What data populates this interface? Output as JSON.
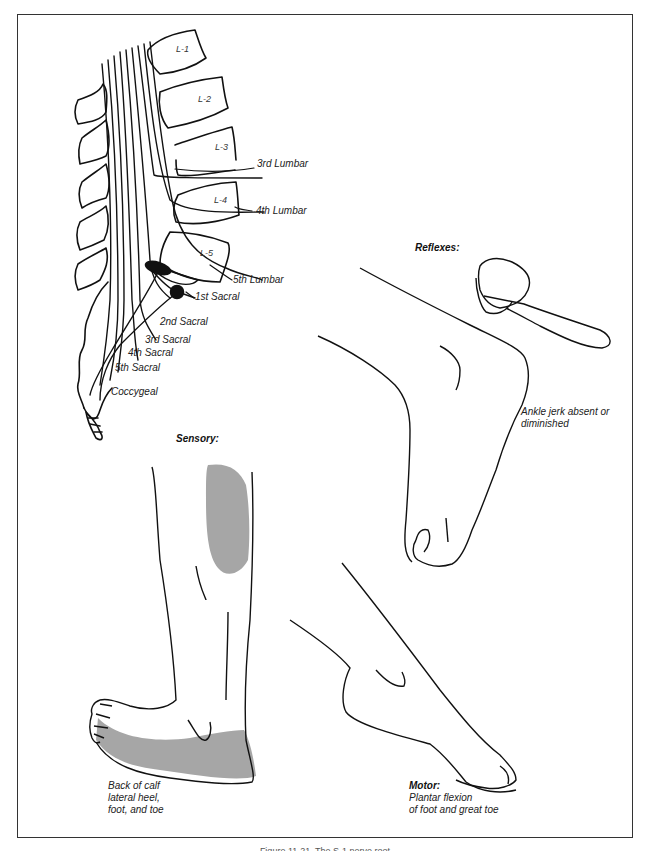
{
  "figure": {
    "caption": "Figure 11-21. The S-1 nerve root"
  },
  "spine": {
    "vertebrae": [
      "L-1",
      "L-2",
      "L-3",
      "L-4",
      "L-5"
    ],
    "nerve_labels": {
      "l3": "3rd Lumbar",
      "l4": "4th Lumbar",
      "l5": "5th Lumbar",
      "s1": "1st Sacral",
      "s2": "2nd Sacral",
      "s3": "3rd Sacral",
      "s4": "4th Sacral",
      "s5": "5th Sacral",
      "coccygeal": "Coccygeal"
    }
  },
  "reflexes": {
    "heading": "Reflexes:",
    "note_line1": "Ankle jerk absent or",
    "note_line2": "diminished"
  },
  "sensory": {
    "heading": "Sensory:",
    "note_line1": "Back of calf",
    "note_line2": "lateral heel,",
    "note_line3": "foot, and toe",
    "shade_color": "#a6a6a6"
  },
  "motor": {
    "heading": "Motor:",
    "note_line1": "Plantar flexion",
    "note_line2": "of foot and great toe"
  }
}
